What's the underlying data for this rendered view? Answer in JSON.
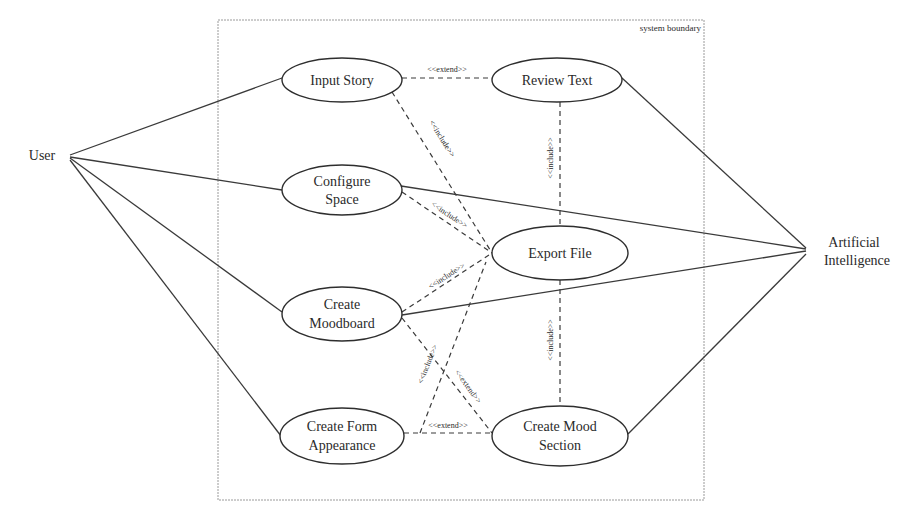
{
  "diagram": {
    "type": "uml-use-case",
    "system_boundary": {
      "label": "system boundary"
    },
    "actors": [
      {
        "id": "user",
        "label": "User"
      },
      {
        "id": "ai",
        "label_line1": "Artificial",
        "label_line2": "Intelligence"
      }
    ],
    "use_cases": [
      {
        "id": "input_story",
        "line1": "Input Story"
      },
      {
        "id": "review_text",
        "line1": "Review Text"
      },
      {
        "id": "configure_space",
        "line1": "Configure",
        "line2": "Space"
      },
      {
        "id": "export_file",
        "line1": "Export File"
      },
      {
        "id": "create_moodboard",
        "line1": "Create",
        "line2": "Moodboard"
      },
      {
        "id": "create_form_appearance",
        "line1": "Create Form",
        "line2": "Appearance"
      },
      {
        "id": "create_mood_section",
        "line1": "Create Mood",
        "line2": "Section"
      }
    ],
    "associations": [
      {
        "from": "User",
        "to": "Input Story"
      },
      {
        "from": "User",
        "to": "Configure Space"
      },
      {
        "from": "User",
        "to": "Create Moodboard"
      },
      {
        "from": "User",
        "to": "Create Form Appearance"
      },
      {
        "from": "Artificial Intelligence",
        "to": "Review Text"
      },
      {
        "from": "Artificial Intelligence",
        "to": "Configure Space"
      },
      {
        "from": "Artificial Intelligence",
        "to": "Create Moodboard"
      },
      {
        "from": "Artificial Intelligence",
        "to": "Create Mood Section"
      }
    ],
    "relations": [
      {
        "from": "Input Story",
        "to": "Review Text",
        "label": "<<extend>>"
      },
      {
        "from": "Input Story",
        "to": "Export File",
        "label": "<<include>>"
      },
      {
        "from": "Configure Space",
        "to": "Export File",
        "label": "<<include>>"
      },
      {
        "from": "Create Moodboard",
        "to": "Export File",
        "label": "<<include>>"
      },
      {
        "from": "Review Text",
        "to": "Export File",
        "label": "<<include>>"
      },
      {
        "from": "Create Mood Section",
        "to": "Export File",
        "label": "<<include>>"
      },
      {
        "from": "Create Form Appearance",
        "to": "Export File",
        "label": "<<include>>"
      },
      {
        "from": "Create Moodboard",
        "to": "Create Mood Section",
        "label": "<<extend>>"
      },
      {
        "from": "Create Mood Section",
        "to": "Create Form Appearance",
        "label": "<<extend>>"
      }
    ]
  }
}
